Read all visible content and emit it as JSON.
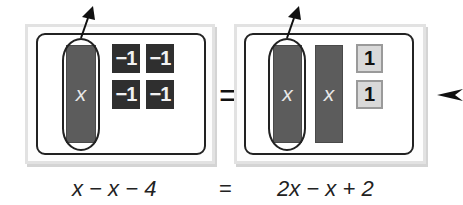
{
  "left_side": {
    "x_tiles": [
      {
        "label": "x"
      }
    ],
    "neg_tiles": [
      {
        "label": "−1"
      },
      {
        "label": "−1"
      },
      {
        "label": "−1"
      },
      {
        "label": "−1"
      }
    ],
    "removed_tile_circled": "x"
  },
  "middle": {
    "equals": "="
  },
  "right_side": {
    "x_tiles": [
      {
        "label": "x"
      },
      {
        "label": "x"
      }
    ],
    "pos_tiles": [
      {
        "label": "1"
      },
      {
        "label": "1"
      }
    ],
    "removed_tile_circled": "x"
  },
  "equation": {
    "left": "x − x − 4",
    "equals": "=",
    "right": "2x − x + 2"
  },
  "icons": {
    "remove_arrows": "arrow-up-right-icon",
    "pointer_arrow": "arrow-left-icon"
  },
  "colors": {
    "x_tile": "#5c5c5c",
    "neg_tile": "#2f2f2f",
    "pos_tile": "#d9d9d9",
    "frame": "#e2e2e2",
    "outline": "#222222"
  }
}
